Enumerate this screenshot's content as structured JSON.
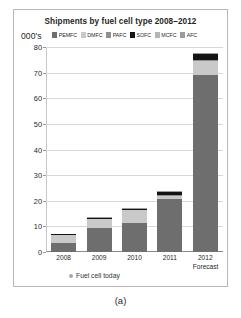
{
  "figure": {
    "caption": "(a)"
  },
  "chart_data": {
    "type": "bar",
    "title": "Shipments by fuel cell type 2008–2012",
    "subtitle": "",
    "xlabel": "",
    "ylabel": "000's",
    "ylim": [
      0,
      80
    ],
    "ytick_values": [
      80,
      70,
      60,
      50,
      40,
      30,
      20,
      10,
      0
    ],
    "ytick_labels": [
      "80",
      "70",
      "60",
      "50",
      "40",
      "30",
      "20",
      "10",
      "0"
    ],
    "grid": true,
    "stacked": true,
    "legend_position": "top",
    "categories": [
      "2008",
      "2009",
      "2010",
      "2011",
      "2012"
    ],
    "category_sublabels": [
      "",
      "",
      "",
      "",
      "Forecast"
    ],
    "series": [
      {
        "name": "PEMFC",
        "color": "#6e6e6e",
        "values": [
          3.6,
          9.2,
          11.3,
          20.6,
          69.0
        ]
      },
      {
        "name": "DMFC",
        "color": "#c9c9c9",
        "values": [
          3.0,
          3.6,
          5.0,
          1.2,
          5.4
        ]
      },
      {
        "name": "PAFC",
        "color": "#8f8f8f",
        "values": [
          0.2,
          0.2,
          0.2,
          0.3,
          0.4
        ]
      },
      {
        "name": "SOFC",
        "color": "#141414",
        "values": [
          0.2,
          0.3,
          0.3,
          1.3,
          2.4
        ]
      },
      {
        "name": "MCFC",
        "color": "#b5b5b5",
        "values": [
          0.1,
          0.1,
          0.1,
          0.2,
          0.2
        ]
      },
      {
        "name": "AFC",
        "color": "#9c9c9c",
        "values": [
          0.1,
          0.1,
          0.1,
          0.1,
          0.2
        ]
      }
    ],
    "totals": [
      7.2,
      13.5,
      17.0,
      23.7,
      77.6
    ],
    "annotations": [
      {
        "text": "Fuel cell today",
        "marker": "dot-marker"
      }
    ]
  }
}
